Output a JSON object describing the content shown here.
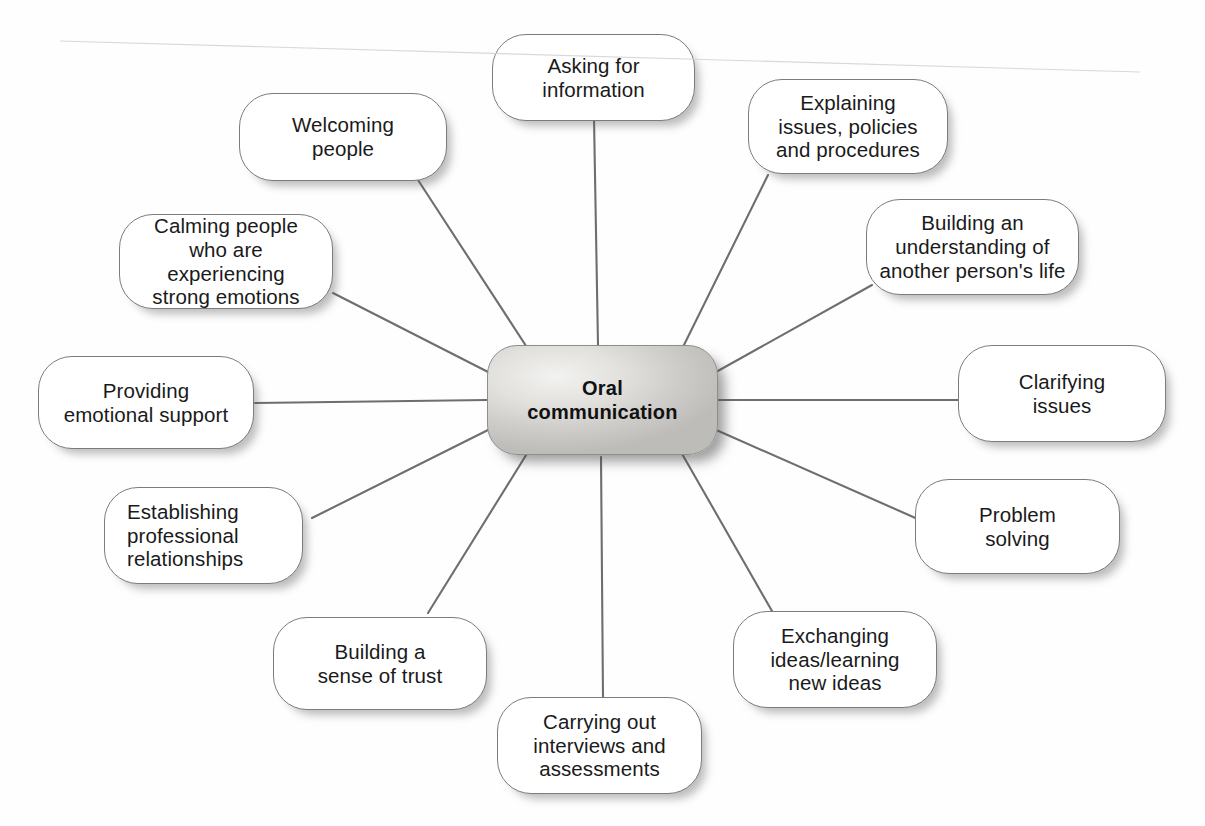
{
  "diagram": {
    "type": "spider-diagram",
    "center": {
      "label": "Oral\ncommunication"
    },
    "nodes": [
      {
        "id": "asking-for-information",
        "label": "Asking for\ninformation"
      },
      {
        "id": "explaining-issues",
        "label": "Explaining\nissues, policies\nand procedures"
      },
      {
        "id": "building-understanding",
        "label": "Building an\nunderstanding of\nanother person's life"
      },
      {
        "id": "clarifying-issues",
        "label": "Clarifying\nissues"
      },
      {
        "id": "problem-solving",
        "label": "Problem\nsolving"
      },
      {
        "id": "exchanging-ideas",
        "label": "Exchanging\nideas/learning\nnew ideas"
      },
      {
        "id": "carrying-out-interviews",
        "label": "Carrying out\ninterviews and\nassessments"
      },
      {
        "id": "building-trust",
        "label": "Building a\nsense of trust"
      },
      {
        "id": "establishing-relationships",
        "label": "Establishing\nprofessional\nrelationships"
      },
      {
        "id": "providing-emotional-support",
        "label": "Providing\nemotional support"
      },
      {
        "id": "calming-people",
        "label": "Calming people\nwho are experiencing\nstrong emotions"
      },
      {
        "id": "welcoming-people",
        "label": "Welcoming\npeople"
      }
    ],
    "colors": {
      "node_fill": "#ffffff",
      "node_border": "#7c7c7c",
      "center_fill": "#dedddb",
      "connector": "#6e6e6e",
      "text": "#1a1a1a",
      "background": "#fefefe"
    }
  }
}
